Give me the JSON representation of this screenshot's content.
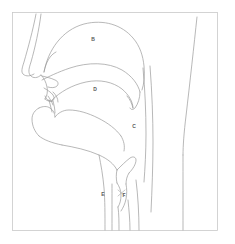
{
  "figure": {
    "background_color": "#ffffff",
    "frame_color": "#c9c9c9",
    "line_color": "#9a9a9a",
    "label_color": "#5a5a5a"
  },
  "labels": [
    {
      "id": "B",
      "text": "B",
      "meaning": "nasal-cavity",
      "x": 93,
      "y": 39
    },
    {
      "id": "D",
      "text": "D",
      "meaning": "oral-cavity",
      "x": 95,
      "y": 89
    },
    {
      "id": "C",
      "text": "C",
      "meaning": "pharynx",
      "x": 134,
      "y": 126
    },
    {
      "id": "E",
      "text": "E",
      "meaning": "larynx",
      "x": 103,
      "y": 194
    },
    {
      "id": "F",
      "text": "F",
      "meaning": "vocal-folds",
      "x": 124,
      "y": 195
    }
  ]
}
